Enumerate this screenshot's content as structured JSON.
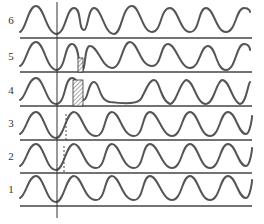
{
  "figure": {
    "type": "waveform-traces",
    "trace_count": 6,
    "stroke_color": "#555555",
    "baseline_color": "#444444",
    "traces": [
      {
        "label": "6",
        "description": "regular waves; second peak follows closely, long gap after third"
      },
      {
        "label": "5",
        "description": "waves with narrow shaded notch between two peaks right of marker"
      },
      {
        "label": "4",
        "description": "wave with wide hatched bar under peak right of marker, then long flat trough"
      },
      {
        "label": "3",
        "description": "regular waves with dashed line at rise right of marker"
      },
      {
        "label": "2",
        "description": "regular waves with dashed line at rise right of marker"
      },
      {
        "label": "1",
        "description": "regular waves"
      }
    ],
    "marker": "vertical reference line through all traces"
  }
}
